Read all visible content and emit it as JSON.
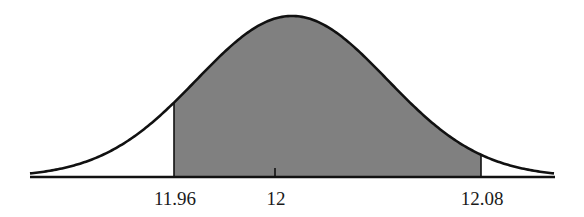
{
  "chart_data": {
    "type": "area",
    "title": "",
    "xlabel": "",
    "ylabel": "",
    "mean": 12,
    "shaded_interval": [
      11.96,
      12.08
    ],
    "tick_labels": [
      "11.96",
      "12",
      "12.08"
    ],
    "tick_values": [
      11.96,
      12,
      12.08
    ],
    "grid": false,
    "legend": null,
    "colors": {
      "shade": "#808080",
      "curve": "#111111",
      "axis": "#111111"
    }
  },
  "labels": {
    "left": "11.96",
    "center": "12",
    "right": "12.08"
  }
}
